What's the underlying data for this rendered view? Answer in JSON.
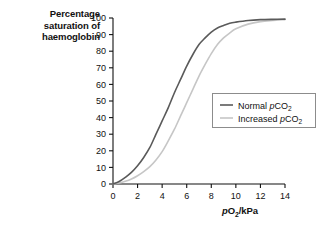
{
  "chart_data": {
    "type": "line",
    "title": "Percentage saturation of haemoglobin",
    "ylabel": "Percentage saturation of haemoglobin",
    "xlabel": "pO2/kPa",
    "xlabel_parts": {
      "pre_italic": "p",
      "main": "O",
      "sub": "2",
      "post": "/kPa"
    },
    "xlim": [
      0,
      14
    ],
    "ylim": [
      0,
      100
    ],
    "xticks": [
      "0",
      "2",
      "4",
      "6",
      "8",
      "10",
      "12",
      "14"
    ],
    "yticks": [
      "0",
      "10",
      "20",
      "30",
      "40",
      "50",
      "60",
      "70",
      "80",
      "90",
      "100"
    ],
    "grid": false,
    "legend_position": "center-right",
    "series": [
      {
        "name": "Normal pCO2",
        "label_parts": {
          "pre": "Normal ",
          "italic": "p",
          "main": "CO",
          "sub": "2"
        },
        "color": "#5a5a5a",
        "p50_kpa": 4.7,
        "x": [
          0,
          0.5,
          1,
          1.5,
          2,
          2.5,
          3,
          3.5,
          4,
          4.5,
          5,
          5.5,
          6,
          6.5,
          7,
          7.5,
          8,
          8.5,
          9,
          9.5,
          10,
          11,
          12,
          13,
          14
        ],
        "y": [
          0,
          1.5,
          4,
          7,
          11,
          16,
          22,
          30,
          38,
          46,
          55,
          63,
          71,
          78,
          84,
          88,
          91.5,
          94,
          95.5,
          96.8,
          97.5,
          98.5,
          99,
          99.2,
          99.3
        ]
      },
      {
        "name": "Increased pCO2",
        "label_parts": {
          "pre": "Increased ",
          "italic": "p",
          "main": "CO",
          "sub": "2"
        },
        "color": "#c6c6c6",
        "p50_kpa": 6.1,
        "x": [
          0,
          0.5,
          1,
          1.5,
          2,
          2.5,
          3,
          3.5,
          4,
          4.5,
          5,
          5.5,
          6,
          6.5,
          7,
          7.5,
          8,
          8.5,
          9,
          9.5,
          10,
          11,
          12,
          13,
          14
        ],
        "y": [
          0,
          0.6,
          1.6,
          3,
          5,
          7.5,
          10.5,
          14.5,
          19.5,
          26,
          33,
          41,
          49,
          57,
          65,
          72,
          78.5,
          84,
          88,
          91,
          93.5,
          96.3,
          97.8,
          98.5,
          99
        ]
      }
    ]
  },
  "legend": {
    "items": [
      {
        "label": "Normal pCO2"
      },
      {
        "label": "Increased pCO2"
      }
    ]
  },
  "colors": {
    "axis": "#111111",
    "series_normal": "#5a5a5a",
    "series_increased": "#c6c6c6",
    "legend_border": "#8c8c8c",
    "background": "#ffffff"
  }
}
